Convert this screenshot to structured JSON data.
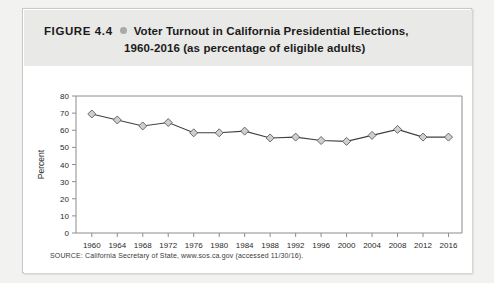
{
  "figure": {
    "label": "FIGURE 4.4",
    "bullet_icon": "bullet-dot-icon",
    "title_line1": "Voter Turnout in California Presidential Elections,",
    "title_line2": "1960-2016 (as percentage of eligible adults)",
    "source_note": "SOURCE: California Secretary of State, www.sos.ca.gov (accessed 11/30/16)."
  },
  "colors": {
    "page_background": "#f2f2f1",
    "card_background": "#ffffff",
    "header_band": "#e9e9e7",
    "bullet": "#a9a9a6",
    "line": "#404040",
    "marker_fill": "#cfcfcf",
    "marker_stroke": "#5a5a5a",
    "axis": "#8c8c8c",
    "text": "#1b1b1b"
  },
  "chart_data": {
    "type": "line",
    "title": "Voter Turnout in California Presidential Elections, 1960-2016 (as percentage of eligible adults)",
    "xlabel": "",
    "ylabel": "Percent",
    "ylim": [
      0,
      80
    ],
    "ytick_step": 10,
    "yticks": [
      0,
      10,
      20,
      30,
      40,
      50,
      60,
      70,
      80
    ],
    "categories": [
      "1960",
      "1964",
      "1968",
      "1972",
      "1976",
      "1980",
      "1984",
      "1988",
      "1992",
      "1996",
      "2000",
      "2004",
      "2008",
      "2012",
      "2016"
    ],
    "values": [
      69.5,
      66,
      62.5,
      64.5,
      58.5,
      58.5,
      59.5,
      55.5,
      56,
      54,
      53.5,
      57,
      60.5,
      56,
      56
    ],
    "grid": false,
    "legend": "none",
    "marker": "diamond",
    "series": [
      {
        "name": "Voter turnout",
        "values": [
          69.5,
          66,
          62.5,
          64.5,
          58.5,
          58.5,
          59.5,
          55.5,
          56,
          54,
          53.5,
          57,
          60.5,
          56,
          56
        ]
      }
    ]
  }
}
